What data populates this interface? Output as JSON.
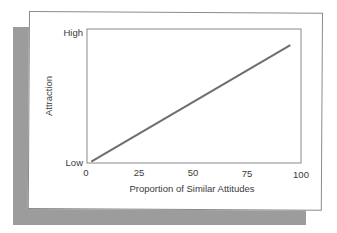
{
  "chart_data": {
    "type": "line",
    "title": "",
    "xlabel": "Proportion of Similar Attitudes",
    "ylabel": "Attraction",
    "x_ticks": [
      "0",
      "25",
      "50",
      "75",
      "100"
    ],
    "y_ticks": [
      "Low",
      "High"
    ],
    "xlim": [
      0,
      100
    ],
    "ylim": [
      "Low",
      "High"
    ],
    "grid": false,
    "legend": null,
    "series": [
      {
        "name": "Attraction",
        "x": [
          2,
          95
        ],
        "y_relative": [
          0.01,
          0.88
        ],
        "color": "#6e6e6e"
      }
    ]
  },
  "colors": {
    "shadow": "#9c9c9c",
    "card": "#ffffff",
    "axis": "#8a8a8a",
    "line": "#6e6e6e"
  }
}
